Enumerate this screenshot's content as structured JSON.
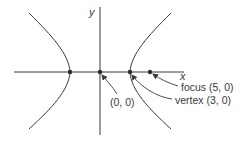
{
  "diagram": {
    "colors": {
      "stroke": "#3a3a3a",
      "background": "#ffffff"
    },
    "axes": {
      "x_label": "x",
      "y_label": "y"
    },
    "points": [
      {
        "name": "left-vertex",
        "coords": "(-3,0)"
      },
      {
        "name": "origin",
        "coords": "(0,0)"
      },
      {
        "name": "right-vertex",
        "coords": "(3,0)"
      },
      {
        "name": "focus",
        "coords": "(5,0)"
      }
    ],
    "annotations": {
      "origin": "(0, 0)",
      "focus": "focus (5, 0)",
      "vertex": "vertex (3, 0)"
    }
  }
}
